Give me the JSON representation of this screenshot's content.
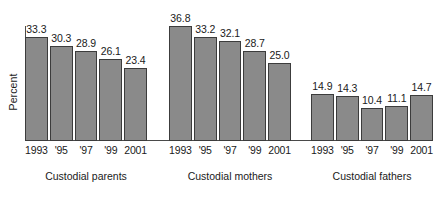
{
  "chart_data": {
    "type": "bar",
    "title": "",
    "xlabel": "",
    "ylabel": "Percent",
    "ylim": [
      0,
      40
    ],
    "grid": false,
    "legend": "none",
    "categories": [
      "1993",
      "'95",
      "'97",
      "'99",
      "2001"
    ],
    "groups": [
      {
        "name": "Custodial parents",
        "values": [
          33.3,
          30.3,
          28.9,
          26.1,
          23.4
        ],
        "value_labels": [
          "33.3",
          "30.3",
          "28.9",
          "26.1",
          "23.4"
        ]
      },
      {
        "name": "Custodial mothers",
        "values": [
          36.8,
          33.2,
          32.1,
          28.7,
          25.0
        ],
        "value_labels": [
          "36.8",
          "33.2",
          "32.1",
          "28.7",
          "25.0"
        ]
      },
      {
        "name": "Custodial fathers",
        "values": [
          14.9,
          14.3,
          10.4,
          11.1,
          14.7
        ],
        "value_labels": [
          "14.9",
          "14.3",
          "10.4",
          "11.1",
          "14.7"
        ]
      }
    ],
    "colors": {
      "bar_fill": "#8a8a8a",
      "bar_border": "#3c3c3c",
      "axis": "#4a4a4a",
      "text": "#1a1a1a",
      "background": "#ffffff"
    }
  }
}
